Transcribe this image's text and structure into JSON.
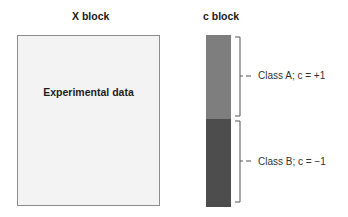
{
  "titles": {
    "x_block": "X block",
    "c_block": "c block"
  },
  "x_block": {
    "label": "Experimental data",
    "fill": "#f3f3f3"
  },
  "c_block": {
    "classes": [
      {
        "label": "Class A; c = +1",
        "fill": "#7e7e7e"
      },
      {
        "label": "Class B; c = −1",
        "fill": "#4d4d4d"
      }
    ]
  }
}
